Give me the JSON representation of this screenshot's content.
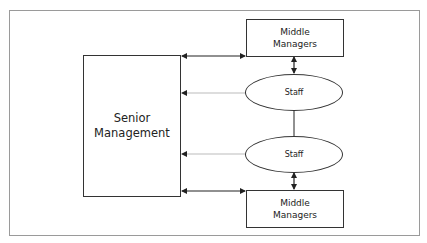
{
  "diagram": {
    "nodes": {
      "senior": {
        "label": "Senior\nManagement"
      },
      "middle_top": {
        "label": "Middle\nManagers"
      },
      "middle_bottom": {
        "label": "Middle\nManagers"
      },
      "staff_top": {
        "label": "Staff"
      },
      "staff_bottom": {
        "label": "Staff"
      }
    },
    "edges": [
      {
        "from": "senior",
        "to": "middle_top",
        "style": "solid",
        "direction": "both"
      },
      {
        "from": "staff_top",
        "to": "senior",
        "style": "light-gray",
        "direction": "to-senior"
      },
      {
        "from": "staff_bottom",
        "to": "senior",
        "style": "light-gray",
        "direction": "to-senior"
      },
      {
        "from": "senior",
        "to": "middle_bottom",
        "style": "solid",
        "direction": "both"
      },
      {
        "from": "middle_top",
        "to": "staff_top",
        "style": "solid",
        "direction": "both"
      },
      {
        "from": "staff_top",
        "to": "staff_bottom",
        "style": "solid",
        "direction": "none"
      },
      {
        "from": "staff_bottom",
        "to": "middle_bottom",
        "style": "solid",
        "direction": "both"
      }
    ],
    "colors": {
      "stroke": "#333333",
      "light_arrow": "#bbbbbb",
      "frame": "#9a9a9a"
    }
  }
}
